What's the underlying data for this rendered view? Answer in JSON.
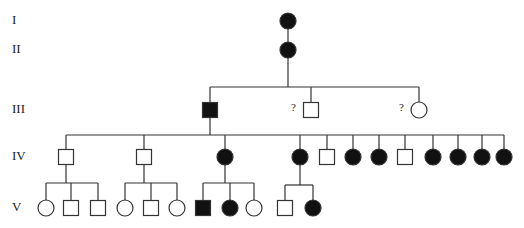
{
  "colors": {
    "line": "#333333",
    "affected": "#111111",
    "unaffected": "#ffffff"
  },
  "generations": [
    {
      "label": "I",
      "y": 21
    },
    {
      "label": "II",
      "y": 50
    },
    {
      "label": "III",
      "y": 110
    },
    {
      "label": "IV",
      "y": 157
    },
    {
      "label": "V",
      "y": 208
    }
  ],
  "unknown_marker": "?",
  "individuals": [
    {
      "id": "I-1",
      "sex": "female",
      "affected": true,
      "x": 288,
      "y": 21
    },
    {
      "id": "II-1",
      "sex": "female",
      "affected": true,
      "x": 288,
      "y": 50
    },
    {
      "id": "III-1",
      "sex": "male",
      "affected": true,
      "x": 210,
      "y": 110
    },
    {
      "id": "III-2",
      "sex": "male",
      "affected": false,
      "unknown": true,
      "x": 311,
      "y": 110
    },
    {
      "id": "III-3",
      "sex": "female",
      "affected": false,
      "unknown": true,
      "x": 419,
      "y": 110
    },
    {
      "id": "IV-1",
      "sex": "male",
      "affected": false,
      "x": 66,
      "y": 157
    },
    {
      "id": "IV-2",
      "sex": "male",
      "affected": false,
      "x": 144,
      "y": 157
    },
    {
      "id": "IV-3",
      "sex": "female",
      "affected": true,
      "x": 225,
      "y": 157
    },
    {
      "id": "IV-4",
      "sex": "female",
      "affected": true,
      "x": 300,
      "y": 157
    },
    {
      "id": "IV-5",
      "sex": "male",
      "affected": false,
      "x": 327,
      "y": 157
    },
    {
      "id": "IV-6",
      "sex": "female",
      "affected": true,
      "x": 353,
      "y": 157
    },
    {
      "id": "IV-7",
      "sex": "female",
      "affected": true,
      "x": 379,
      "y": 157
    },
    {
      "id": "IV-8",
      "sex": "male",
      "affected": false,
      "x": 405,
      "y": 157
    },
    {
      "id": "IV-9",
      "sex": "female",
      "affected": true,
      "x": 433,
      "y": 157
    },
    {
      "id": "IV-10",
      "sex": "female",
      "affected": true,
      "x": 458,
      "y": 157
    },
    {
      "id": "IV-11",
      "sex": "female",
      "affected": true,
      "x": 482,
      "y": 157
    },
    {
      "id": "IV-12",
      "sex": "female",
      "affected": true,
      "x": 504,
      "y": 157
    },
    {
      "id": "V-1",
      "sex": "female",
      "affected": false,
      "x": 46,
      "y": 208
    },
    {
      "id": "V-2",
      "sex": "male",
      "affected": false,
      "x": 71,
      "y": 208
    },
    {
      "id": "V-3",
      "sex": "male",
      "affected": false,
      "x": 98,
      "y": 208
    },
    {
      "id": "V-4",
      "sex": "female",
      "affected": false,
      "x": 125,
      "y": 208
    },
    {
      "id": "V-5",
      "sex": "male",
      "affected": false,
      "x": 151,
      "y": 208
    },
    {
      "id": "V-6",
      "sex": "female",
      "affected": false,
      "x": 177,
      "y": 208
    },
    {
      "id": "V-7",
      "sex": "male",
      "affected": true,
      "x": 203,
      "y": 208
    },
    {
      "id": "V-8",
      "sex": "female",
      "affected": true,
      "x": 230,
      "y": 208
    },
    {
      "id": "V-9",
      "sex": "female",
      "affected": false,
      "x": 254,
      "y": 208
    },
    {
      "id": "V-10",
      "sex": "male",
      "affected": false,
      "x": 285,
      "y": 208
    },
    {
      "id": "V-11",
      "sex": "female",
      "affected": true,
      "x": 313,
      "y": 208
    }
  ],
  "sibships": [
    {
      "parent": "I-1",
      "children": [
        "II-1"
      ]
    },
    {
      "parent": "II-1",
      "bar_y": 87,
      "children": [
        "III-1",
        "III-2",
        "III-3"
      ]
    },
    {
      "parent": "III-1",
      "bar_y": 135,
      "children": [
        "IV-1",
        "IV-2",
        "IV-3",
        "IV-4",
        "IV-5",
        "IV-6",
        "IV-7",
        "IV-8",
        "IV-9",
        "IV-10",
        "IV-11",
        "IV-12"
      ]
    },
    {
      "parent": "IV-1",
      "bar_y": 183,
      "children": [
        "V-1",
        "V-2",
        "V-3"
      ]
    },
    {
      "parent": "IV-2",
      "bar_y": 183,
      "children": [
        "V-4",
        "V-5",
        "V-6"
      ]
    },
    {
      "parent": "IV-3",
      "bar_y": 183,
      "children": [
        "V-7",
        "V-8",
        "V-9"
      ]
    },
    {
      "parent": "IV-4",
      "bar_y": 185,
      "children": [
        "V-10",
        "V-11"
      ]
    }
  ]
}
